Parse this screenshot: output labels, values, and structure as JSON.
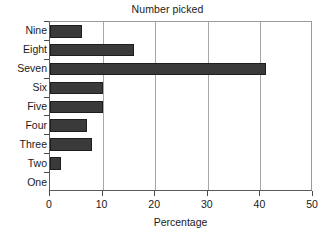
{
  "chart_data": {
    "type": "bar",
    "orientation": "horizontal",
    "title": "Number picked",
    "xlabel": "Percentage",
    "ylabel": "",
    "categories": [
      "One",
      "Two",
      "Three",
      "Four",
      "Five",
      "Six",
      "Seven",
      "Eight",
      "Nine"
    ],
    "values": [
      0,
      2,
      8,
      7,
      10,
      10,
      41,
      16,
      6
    ],
    "xlim": [
      0,
      50
    ],
    "xticks": [
      0,
      10,
      20,
      30,
      40,
      50
    ],
    "xtick_labels": [
      "0",
      "10",
      "20",
      "30",
      "40",
      "50"
    ],
    "grid": "vertical",
    "legend": "none",
    "bar_color": "#3a3a3a",
    "bar_edge_color": "#1e1e1e",
    "axis_color": "#5a5a5a",
    "grid_color": "#a8a8a8",
    "background": "#ffffff"
  }
}
